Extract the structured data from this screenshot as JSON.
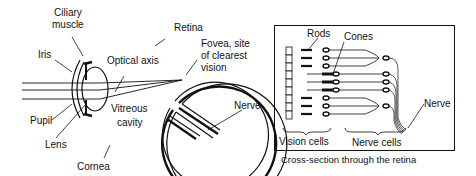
{
  "left_figure": {
    "labels": {
      "ciliary_muscle_1": "Ciliary",
      "ciliary_muscle_2": "muscle",
      "retina": "Retina",
      "iris": "Iris",
      "optical_axis": "Optical axis",
      "fovea_1": "Fovea, site",
      "fovea_2": "of clearest",
      "fovea_3": "vision",
      "vitreous_1": "Vitreous",
      "vitreous_2": "cavity",
      "nerve": "Nerve",
      "pupil": "Pupil",
      "lens": "Lens",
      "cornea": "Cornea"
    }
  },
  "right_figure": {
    "labels": {
      "rods": "Rods",
      "cones": "Cones",
      "nerve": "Nerve",
      "vision_cells": "Vision cells",
      "nerve_cells": "Nerve cells"
    },
    "caption": "Cross-section through the retina"
  }
}
